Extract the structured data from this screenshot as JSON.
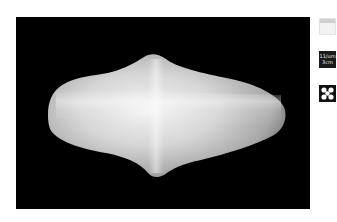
{
  "viewer": {
    "background_color": "#000000",
    "object_color": "#d8d8d8",
    "object_label": "3D model"
  },
  "side_tools": [
    {
      "name": "background-toggle",
      "icon": "background-icon"
    },
    {
      "name": "scale",
      "icon": "scale-icon",
      "line1": "11/um",
      "line2": "3cm"
    },
    {
      "name": "view-mode",
      "icon": "quatrefoil-icon"
    }
  ]
}
